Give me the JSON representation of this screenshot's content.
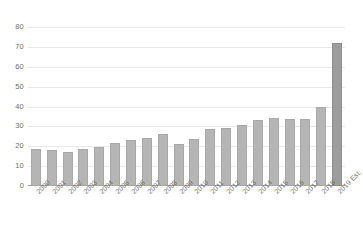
{
  "chart_data": {
    "type": "bar",
    "title": "",
    "subtitle": "",
    "xlabel": "",
    "ylabel": "",
    "ylim": [
      0,
      80
    ],
    "ytick_step": 10,
    "yticks": [
      "80",
      "70",
      "60",
      "50",
      "40",
      "30",
      "20",
      "10",
      "0"
    ],
    "grid": true,
    "legend": false,
    "legend_position": "none",
    "categories": [
      "2000",
      "2001",
      "2002",
      "2003",
      "2004",
      "2005",
      "2006",
      "2007",
      "2008",
      "2009",
      "2010",
      "2011",
      "2012",
      "2013",
      "2014",
      "2015",
      "2016",
      "2017",
      "2018",
      "2019 Est."
    ],
    "values": [
      18.5,
      18.0,
      17.3,
      18.4,
      19.7,
      21.8,
      23.4,
      24.4,
      26.0,
      21.0,
      23.8,
      28.6,
      29.2,
      30.6,
      33.0,
      34.0,
      33.8,
      33.6,
      40.0,
      72.0
    ],
    "series": [
      {
        "name": "Value",
        "values": [
          18.5,
          18.0,
          17.3,
          18.4,
          19.7,
          21.8,
          23.4,
          24.4,
          26.0,
          21.0,
          23.8,
          28.6,
          29.2,
          30.6,
          33.0,
          34.0,
          33.8,
          33.6,
          40.0,
          72.0
        ]
      }
    ],
    "highlight_index": 19,
    "colors": {
      "bar": "#b5b5b5",
      "bar_highlight": "#9d9d9d",
      "gridline": "#e8e8e8",
      "axis": "#9a9a9a",
      "tick_text": "#6e6e6e",
      "background": "#ffffff"
    }
  }
}
